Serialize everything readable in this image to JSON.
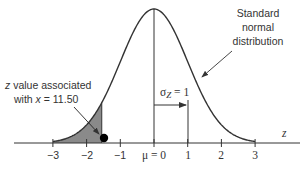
{
  "chart_data": {
    "type": "area",
    "title": "",
    "xlabel": "z",
    "ylabel": "",
    "xlim": [
      -3,
      3
    ],
    "x_ticks": [
      -3,
      -2,
      -1,
      0,
      1,
      2,
      3
    ],
    "x_tick_labels": [
      "−3",
      "−2",
      "−1",
      "μ = 0",
      "1",
      "2",
      "3"
    ],
    "series": [
      {
        "name": "Standard normal distribution",
        "mean": 0,
        "sd": 1
      }
    ],
    "shaded_region": {
      "from": -3,
      "to": -1.55,
      "color": "#8a8a8a"
    },
    "marker_point": {
      "z": -1.55,
      "label": "z value associated with x = 11.50"
    },
    "annotations": [
      {
        "text": "Standard",
        "line": 1
      },
      {
        "text": "normal",
        "line": 2
      },
      {
        "text": "distribution",
        "line": 3
      },
      {
        "text": "σZ = 1",
        "type": "sigma-label"
      },
      {
        "text": "z value associated",
        "line": 1
      },
      {
        "text": "with x = 11.50",
        "line": 2
      }
    ],
    "grid": false,
    "legend": null
  },
  "labels": {
    "dist_line1": "Standard",
    "dist_line2": "normal",
    "dist_line3": "distribution",
    "sigma_symbol": "σ",
    "sigma_sub": "Z",
    "sigma_value": " = 1",
    "zval_line1_italic": "z",
    "zval_line1_rest": " value associated",
    "zval_line2_pre": "with ",
    "zval_line2_italic": "x",
    "zval_line2_rest": " = 11.50",
    "axis_var": "z",
    "tick_m3": "−3",
    "tick_m2": "−2",
    "tick_m1": "−1",
    "tick_0": "μ = 0",
    "tick_1": "1",
    "tick_2": "2",
    "tick_3": "3"
  },
  "colors": {
    "curve": "#333333",
    "shade": "#8a8a8a",
    "axis": "#333333",
    "point": "#000000"
  }
}
